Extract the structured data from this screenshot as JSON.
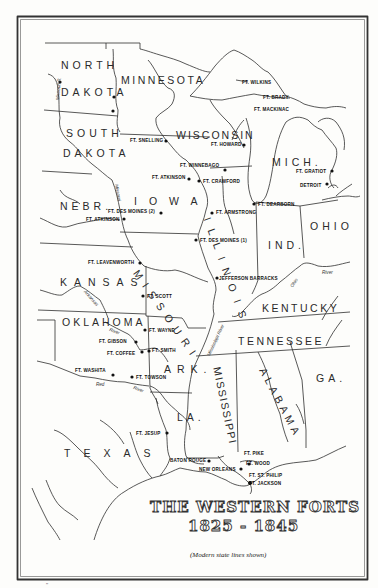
{
  "map": {
    "title_line1": "THE WESTERN FORTS",
    "title_line2": "1825 - 1845",
    "note": "(Modern state lines shown)",
    "bottom_mark": "\"",
    "colors": {
      "ink": "#2a2a2a",
      "paper": "#fdfdfb",
      "fort_dot": "#111111"
    }
  },
  "states": {
    "north": "NORTH",
    "dakota_n": "DAKOTA",
    "south": "SOUTH",
    "dakota_s": "DAKOTA",
    "minnesota": "MINNESOTA",
    "wisconsin": "WISCONSIN",
    "mich": "MICH.",
    "iowa": "IOWA",
    "nebr": "NEBR.",
    "kansas": "KANSAS",
    "missouri": "MISSOURI",
    "illinois": "ILLINOIS",
    "ind": "IND.",
    "ohio": "OHIO",
    "kentucky": "KENTUCKY",
    "tennessee": "TENNESSEE",
    "oklahoma": "OKLAHOMA",
    "ark": "ARK.",
    "mississippi": "MISSISSIPPI",
    "alabama": "ALABAMA",
    "ga": "GA.",
    "la": "LA.",
    "texas": "TEXAS"
  },
  "forts": [
    {
      "name": "FT. WILKINS",
      "x": 238,
      "y": 82
    },
    {
      "name": "FT. BRADY",
      "x": 294,
      "y": 97
    },
    {
      "name": "FT. MACKINAC",
      "x": 292,
      "y": 111
    },
    {
      "name": "FT. SNELLING",
      "x": 166,
      "y": 141
    },
    {
      "name": "FT. HOWARD",
      "x": 244,
      "y": 145
    },
    {
      "name": "FT. WINNEBAGO",
      "x": 225,
      "y": 170
    },
    {
      "name": "FT. ATKINSON",
      "x": 189,
      "y": 179
    },
    {
      "name": "FT. CRAWFORD",
      "x": 199,
      "y": 181
    },
    {
      "name": "FT. GRATIOT",
      "x": 332,
      "y": 171
    },
    {
      "name": "DETROIT",
      "x": 327,
      "y": 184
    },
    {
      "name": "FT. DEARBORN",
      "x": 254,
      "y": 204
    },
    {
      "name": "FT. ARMSTRONG",
      "x": 212,
      "y": 213
    },
    {
      "name": "FT. DES MOINES (2)",
      "x": 161,
      "y": 213
    },
    {
      "name": "FT. ATKINSON",
      "x": 124,
      "y": 219
    },
    {
      "name": "FT. DES MOINES (1)",
      "x": 196,
      "y": 240
    },
    {
      "name": "FT. LEAVENWORTH",
      "x": 140,
      "y": 263
    },
    {
      "name": "JEFFERSON BARRACKS",
      "x": 217,
      "y": 278
    },
    {
      "name": "FT. SCOTT",
      "x": 143,
      "y": 296
    },
    {
      "name": "FT. WAYNE",
      "x": 145,
      "y": 330
    },
    {
      "name": "FT. GIBSON",
      "x": 136,
      "y": 342
    },
    {
      "name": "FT. COFFEE",
      "x": 142,
      "y": 352
    },
    {
      "name": "FT. SMITH",
      "x": 149,
      "y": 351
    },
    {
      "name": "FT. WASHITA",
      "x": 113,
      "y": 375
    },
    {
      "name": "FT. TOWSON",
      "x": 132,
      "y": 377
    },
    {
      "name": "FT. JESUP",
      "x": 167,
      "y": 433
    },
    {
      "name": "BATON ROUGE",
      "x": 209,
      "y": 461
    },
    {
      "name": "FT. PIKE",
      "x": 262,
      "y": 454
    },
    {
      "name": "FT. WOOD",
      "x": 258,
      "y": 464
    },
    {
      "name": "NEW ORLEANS",
      "x": 233,
      "y": 469
    },
    {
      "name": "FT. ST. PHILIP",
      "x": 263,
      "y": 476
    },
    {
      "name": "FT. JACKSON",
      "x": 250,
      "y": 483
    }
  ],
  "rivers": {
    "missouri_upper": "Missouri R.",
    "missouri_lower": "Missouri",
    "ohio": "River",
    "ohio_bend": "Ohio",
    "arkansas": "Arkansas",
    "arkansas_river": "River",
    "red": "Red",
    "red_river": "River",
    "mississippi": "Mississippi River"
  }
}
